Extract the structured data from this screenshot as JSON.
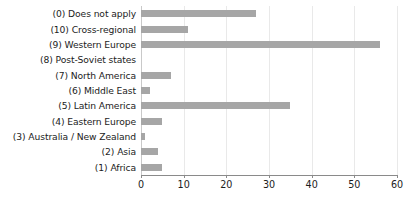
{
  "chart_data": {
    "type": "bar",
    "orientation": "horizontal",
    "title": "",
    "xlabel": "",
    "ylabel": "",
    "xlim": [
      0,
      60
    ],
    "xticks": [
      0,
      10,
      20,
      30,
      40,
      50,
      60
    ],
    "grid": true,
    "legend": null,
    "bar_color": "#a6a6a6",
    "axis_color": "#8a8a8a",
    "text_color": "#1c1c1c",
    "categories": [
      "(0) Does not apply",
      "(10) Cross-regional",
      "(9) Western Europe",
      "(8) Post-Soviet states",
      "(7) North America",
      "(6) Middle East",
      "(5) Latin America",
      "(4) Eastern Europe",
      "(3) Australia / New Zealand",
      "(2) Asia",
      "(1) Africa"
    ],
    "values": [
      27,
      11,
      56,
      0,
      7,
      2,
      35,
      5,
      1,
      4,
      5
    ]
  }
}
